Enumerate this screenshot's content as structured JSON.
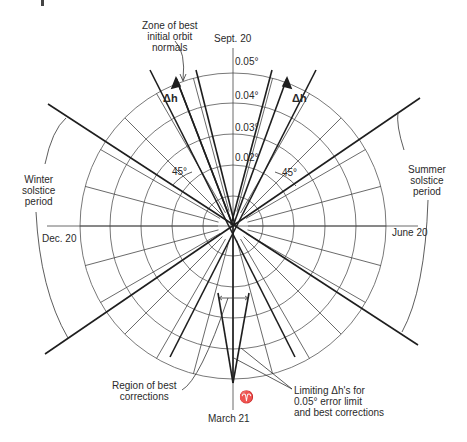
{
  "diagram": {
    "center": {
      "x": 233,
      "y": 226
    },
    "ring_radii": [
      30,
      61,
      92,
      123,
      153
    ],
    "ring_labels": [
      "0.02°",
      "0.03°",
      "0.04°",
      "0.05°"
    ],
    "season_labels": {
      "top": "Sept. 20",
      "bottom": "March 21",
      "left": "Dec. 20",
      "right": "June 20",
      "aries_symbol": "♈"
    },
    "annotations": {
      "zone_best_normals": [
        "Zone of best",
        "initial orbit",
        "normals"
      ],
      "winter": [
        "Winter",
        "solstice",
        "period"
      ],
      "summer": [
        "Summer",
        "solstice",
        "period"
      ],
      "region_best_corrections": [
        "Region of best",
        "corrections"
      ],
      "limiting_dh": [
        "Limiting Δh's for",
        "0.05° error limit",
        "and best corrections"
      ],
      "delta_h_left": "Δh",
      "delta_h_right": "Δh",
      "angle_left": "45°",
      "angle_right": "45°"
    },
    "colors": {
      "line": "#2a2a2a",
      "grid": "#555555",
      "background": "#ffffff"
    }
  }
}
